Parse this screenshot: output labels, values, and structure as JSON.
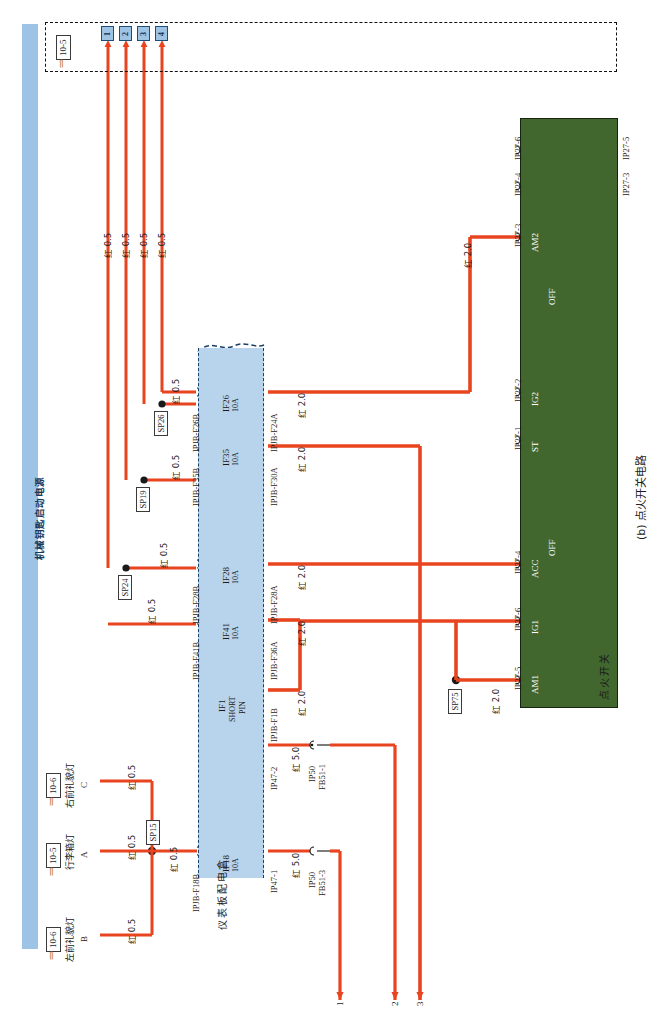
{
  "page": {
    "caption": "(b) 点火开关电路",
    "spine_label": "机械钥匙启动电源"
  },
  "colors": {
    "wire_red": "#e8441f",
    "fusebox_blue": "#b8d4ed",
    "spine_blue": "#9dc3e6",
    "ignition_green": "#41672f",
    "chip_blue": "#9fc3e3",
    "ref_arrow": "#c9833a"
  },
  "top_reference": {
    "tag": "10-5",
    "arrow": "⇒",
    "terminals": [
      "1",
      "2",
      "3",
      "4"
    ]
  },
  "top_wires": [
    {
      "label": "红 0.5"
    },
    {
      "label": "红 0.5"
    },
    {
      "label": "红 0.5"
    },
    {
      "label": "红 0.5"
    }
  ],
  "splices": [
    {
      "id": "SP24"
    },
    {
      "id": "SP19"
    },
    {
      "id": "SP26"
    },
    {
      "id": "SP15"
    },
    {
      "id": "SP75"
    }
  ],
  "splice_wires": [
    {
      "label": "红 0.5"
    },
    {
      "label": "红 0.5"
    },
    {
      "label": "红 0.5"
    },
    {
      "label": "红 0.5"
    }
  ],
  "fusebox": {
    "name": "仪表板配电盒",
    "rows": [
      {
        "fuse": "IF26",
        "rating": "10A",
        "left_terminal": "IPJB-F26B",
        "right_terminal": "IPJB-F24A",
        "out_wire": "红 2.0"
      },
      {
        "fuse": "IF35",
        "rating": "10A",
        "left_terminal": "IPJB-F35B",
        "right_terminal": "IPJB-F30A",
        "out_wire": "红 2.0"
      },
      {
        "fuse": "IF28",
        "rating": "10A",
        "left_terminal": "IPJB-F28B",
        "right_terminal": "IPJB-F28A",
        "out_wire": "红 2.0"
      },
      {
        "fuse": "IF41",
        "rating": "10A",
        "left_terminal": "IPJB-F41B",
        "right_terminal": "IPJB-F36A",
        "out_wire": "红 2.0"
      },
      {
        "fuse": "IF1",
        "rating": "SHORT PIN",
        "rating_line1": "SHORT",
        "rating_line2": "PIN",
        "left_terminal": "",
        "right_terminal": "IPJB-F1B",
        "out_wire": "红 2.0"
      },
      {
        "fuse": "IF18",
        "rating": "10A",
        "left_terminal": "IPJB-F18B",
        "right_terminal": "IP47-1",
        "out_wire": "红 5.0"
      }
    ],
    "extra_terminal": {
      "name": "IP47-2",
      "out_wire": "红 5.0"
    }
  },
  "bottom_connectors": [
    {
      "name": "IP50",
      "pin": "FB51-1"
    },
    {
      "name": "IP50",
      "pin": "FB51-3"
    }
  ],
  "bottom_wire_numbers": [
    "1",
    "2",
    "3"
  ],
  "left_devices": [
    {
      "tag": "10-6",
      "arrow": "⇒",
      "name": "左前礼貌灯",
      "pin": "B",
      "wire": "红 0.5"
    },
    {
      "tag": "10-5",
      "arrow": "⇒",
      "name": "行李箱灯",
      "pin": "A",
      "wire": "红 0.5"
    },
    {
      "tag": "10-6",
      "arrow": "⇒",
      "name": "右前礼貌灯",
      "pin": "C",
      "wire": "红 0.5"
    }
  ],
  "ignition_switch": {
    "name": "点火开关",
    "positions": [
      "AM2",
      "IG2",
      "ST",
      "OFF",
      "ACC",
      "OFF",
      "IG1",
      "AM1"
    ],
    "terminals_top": [
      "IP27-6",
      "IP27-4",
      "IP27-3",
      "IP27-2",
      "IP27-1",
      "IP27-4",
      "IP27-6",
      "IP27-5"
    ],
    "terminals_bottom": [
      "IP27-5",
      "IP27-3"
    ],
    "terminal_list": [
      {
        "name": "IP27-6",
        "side": "top"
      },
      {
        "name": "IP27-5",
        "side": "bottom"
      },
      {
        "name": "IP27-4",
        "side": "top"
      },
      {
        "name": "IP27-3",
        "side": "bottom"
      },
      {
        "name": "IP27-3",
        "side": "top",
        "pos": "AM2"
      },
      {
        "name": "IP27-2",
        "side": "top",
        "pos": "IG2"
      },
      {
        "name": "IP27-1",
        "side": "top",
        "pos": "ST"
      },
      {
        "name": "IP27-4",
        "side": "top",
        "pos": "ACC"
      },
      {
        "name": "IP27-6",
        "side": "top",
        "pos": "IG1"
      },
      {
        "name": "IP27-5",
        "side": "top",
        "pos": "AM1"
      }
    ],
    "input_wires": [
      {
        "label": "红 2.0"
      },
      {
        "label": "红 2.0"
      },
      {
        "label": "红 2.0"
      },
      {
        "label": "红 2.0"
      },
      {
        "label": "红 2.0"
      }
    ],
    "off_labels": [
      "OFF",
      "OFF"
    ]
  }
}
